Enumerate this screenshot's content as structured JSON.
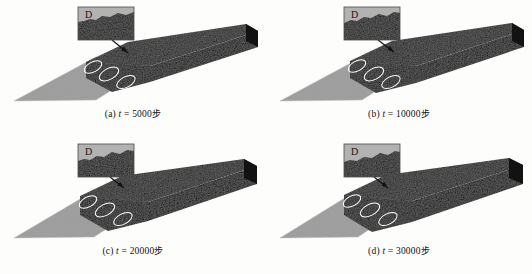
{
  "figure": {
    "type": "multi-panel-simulation-snapshots",
    "columns": 2,
    "rows": 2,
    "background_color": "#fdfdfc"
  },
  "colors": {
    "dark_material": "#1f1f1f",
    "dark_material_top": "#2b2b2b",
    "dark_material_side": "#141414",
    "light_material": "#9d9d9d",
    "light_material_edge": "#c9c9c9",
    "inset_background": "#b2b2b2",
    "inset_border": "#4a4a4a",
    "annotation_ellipse": "#ffffff",
    "arrow": "#111111",
    "caption_text": "#111111"
  },
  "inset": {
    "label": "D",
    "label_name": "zoom-region-label",
    "arrow_name": "inset-pointer-arrow"
  },
  "annotations": {
    "ellipse_count": 3,
    "ellipse_name": "vortex-marker-ellipse"
  },
  "panels": [
    {
      "id": "a",
      "index_label": "(a)",
      "variable": "t",
      "equals": "=",
      "value": "5000",
      "unit": "步",
      "caption": "(a) t = 5000步",
      "dark_extent": 0.62,
      "inset": {
        "label": "D"
      }
    },
    {
      "id": "b",
      "index_label": "(b)",
      "variable": "t",
      "equals": "=",
      "value": "10000",
      "unit": "步",
      "caption": "(b) t = 10000步",
      "dark_extent": 0.66,
      "inset": {
        "label": "D"
      }
    },
    {
      "id": "c",
      "index_label": "(c)",
      "variable": "t",
      "equals": "=",
      "value": "20000",
      "unit": "步",
      "caption": "(c) t = 20000步",
      "dark_extent": 0.7,
      "inset": {
        "label": "D"
      }
    },
    {
      "id": "d",
      "index_label": "(d)",
      "variable": "t",
      "equals": "=",
      "value": "30000",
      "unit": "步",
      "caption": "(d) t = 30000步",
      "dark_extent": 0.74,
      "inset": {
        "label": "D"
      }
    }
  ]
}
